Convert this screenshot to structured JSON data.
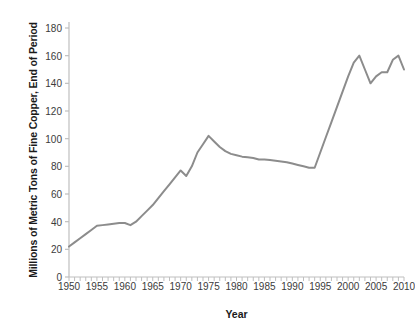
{
  "chart_data": {
    "type": "line",
    "title": "",
    "xlabel": "Year",
    "ylabel": "Millions of Metric Tons of Fine Copper, End of Period",
    "xlim": [
      1950,
      2010
    ],
    "ylim": [
      0,
      180
    ],
    "y_ticks": [
      0,
      20,
      40,
      60,
      80,
      100,
      120,
      140,
      160,
      180
    ],
    "y_tick_labels": [
      "0",
      "20",
      "40",
      "60",
      "80",
      "100",
      "120",
      "140",
      "160",
      "180"
    ],
    "x_ticks": [
      1950,
      1955,
      1960,
      1965,
      1970,
      1975,
      1980,
      1985,
      1990,
      1995,
      2000,
      2005,
      2010
    ],
    "x_tick_labels": [
      "1950",
      "1955",
      "1960",
      "1965",
      "1970",
      "1975",
      "1980",
      "1985",
      "1990",
      "1995",
      "2000",
      "2005",
      "2010"
    ],
    "x_minor_tick_interval": 1,
    "grid": false,
    "legend": false,
    "legend_position": "none",
    "line_color": "#8c8c8c",
    "line_width": 2,
    "axis_color": "#bfbfbf",
    "series": [
      {
        "name": "World Copper Reserves",
        "x": [
          1950,
          1951,
          1952,
          1953,
          1954,
          1955,
          1956,
          1957,
          1958,
          1959,
          1960,
          1961,
          1962,
          1963,
          1964,
          1965,
          1966,
          1967,
          1968,
          1969,
          1970,
          1971,
          1972,
          1973,
          1974,
          1975,
          1976,
          1977,
          1978,
          1979,
          1980,
          1981,
          1982,
          1983,
          1984,
          1985,
          1986,
          1987,
          1988,
          1989,
          1990,
          1991,
          1992,
          1993,
          1994,
          1995,
          1996,
          1997,
          1998,
          1999,
          2000,
          2001,
          2002,
          2003,
          2004,
          2005,
          2006,
          2007,
          2008,
          2009,
          2010
        ],
        "values": [
          22,
          25,
          28,
          31,
          34,
          37,
          37.5,
          38,
          38.5,
          39,
          39,
          37.5,
          40,
          44,
          48,
          52,
          57,
          62,
          67,
          72,
          77,
          73,
          80,
          90,
          96,
          102,
          98,
          94,
          91,
          89,
          88,
          87,
          86.5,
          86,
          85,
          85,
          84.5,
          84,
          83.5,
          83,
          82,
          81,
          80,
          79,
          79,
          90,
          101,
          112,
          123,
          134,
          145,
          155,
          160,
          150,
          140,
          145,
          148,
          148,
          157,
          160,
          150
        ]
      }
    ]
  }
}
